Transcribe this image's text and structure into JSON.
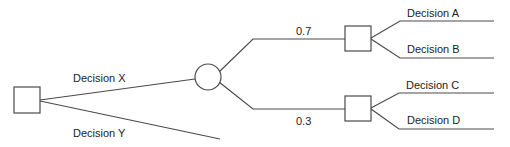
{
  "diagram": {
    "type": "decision-tree",
    "colors": {
      "stroke": "#4a4a4a",
      "text": "#222222",
      "background": "#ffffff"
    },
    "nodes": [
      {
        "id": "root",
        "shape": "square",
        "x": 14,
        "y": 87,
        "w": 26,
        "h": 26
      },
      {
        "id": "chance",
        "shape": "circle",
        "cx": 208,
        "cy": 77,
        "r": 13
      },
      {
        "id": "upper",
        "shape": "square",
        "x": 345,
        "y": 26,
        "w": 26,
        "h": 25
      },
      {
        "id": "lower",
        "shape": "square",
        "x": 345,
        "y": 96,
        "w": 26,
        "h": 25
      }
    ],
    "labels": {
      "decision_x": "Decision X",
      "decision_y": "Decision Y",
      "prob_upper": "0.7",
      "prob_lower": "0.3",
      "decision_a": "Decision A",
      "decision_b": "Decision B",
      "decision_c": "Decision C",
      "decision_d": "Decision D"
    }
  }
}
